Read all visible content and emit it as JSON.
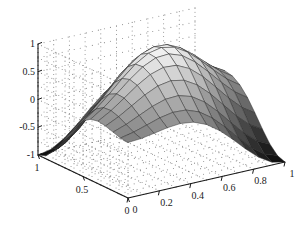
{
  "chart_data": {
    "type": "surface",
    "title": "",
    "xlabel": "",
    "ylabel": "",
    "zlabel": "",
    "xlim": [
      0,
      1
    ],
    "ylim": [
      0,
      1
    ],
    "zlim": [
      -1,
      1
    ],
    "xticks": [
      0,
      0.2,
      0.4,
      0.6,
      0.8,
      1
    ],
    "xticklabels": [
      "0",
      "0.2",
      "0.4",
      "0.6",
      "0.8",
      "1"
    ],
    "yticks": [
      0,
      0.5,
      1
    ],
    "yticklabels": [
      "0",
      "0.5",
      "1"
    ],
    "zticks": [
      -1,
      -0.5,
      0,
      0.5,
      1
    ],
    "zticklabels": [
      "-1",
      "-0.5",
      "0",
      "0.5",
      "1"
    ],
    "grid": "dotted",
    "legend": "none",
    "colormap": "gray",
    "mesh_nx": 13,
    "mesh_ny": 13,
    "surface_description": "saddle / hyperbolic-paraboloid shaped mesh surface peaking near z=1 at the back centre and dipping to about z=-0.7 at the left and right corners",
    "z_formula": "sin(pi*x)*sin(pi*y) style saddle: z = cos(pi*(x+y)) blended ridge",
    "z_samples": {
      "x": [
        0,
        0.0833,
        0.1667,
        0.25,
        0.3333,
        0.4167,
        0.5,
        0.5833,
        0.6667,
        0.75,
        0.8333,
        0.9167,
        1
      ],
      "y": [
        0,
        0.0833,
        0.1667,
        0.25,
        0.3333,
        0.4167,
        0.5,
        0.5833,
        0.6667,
        0.75,
        0.8333,
        0.9167,
        1
      ],
      "note": "z(x,y) = cos(pi*(x - y)) * (0.5 + 0.5*cos(pi*(x + y - 1)))"
    },
    "view": {
      "azimuth": -37.5,
      "elevation": 30
    }
  },
  "axes": {
    "z_ticks": [
      {
        "label": "1",
        "value": 1
      },
      {
        "label": "0.5",
        "value": 0.5
      },
      {
        "label": "0",
        "value": 0
      },
      {
        "label": "-0.5",
        "value": -0.5
      },
      {
        "label": "-1",
        "value": -1
      }
    ],
    "y_ticks": [
      {
        "label": "1",
        "value": 1
      },
      {
        "label": "0.5",
        "value": 0.5
      },
      {
        "label": "0",
        "value": 0
      }
    ],
    "x_ticks": [
      {
        "label": "0",
        "value": 0
      },
      {
        "label": "0.2",
        "value": 0.2
      },
      {
        "label": "0.4",
        "value": 0.4
      },
      {
        "label": "0.6",
        "value": 0.6
      },
      {
        "label": "0.8",
        "value": 0.8
      },
      {
        "label": "1",
        "value": 1
      }
    ]
  },
  "colors": {
    "axis": "#1a1a1a",
    "grid_dot": "#8c8c8c",
    "mesh_line": "#262626",
    "background": "#ffffff",
    "surface_light": "#f2f2f2",
    "surface_dark": "#0d0d0d"
  }
}
